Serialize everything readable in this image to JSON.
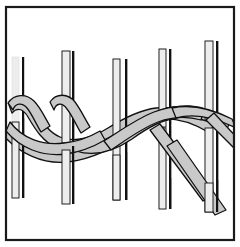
{
  "figure": {
    "title": "Twined basketry weave illustration",
    "canvas": {
      "width": 240,
      "height": 247
    },
    "frame": {
      "name": "illustration-border",
      "x": 5,
      "y": 6,
      "width": 230,
      "height": 235,
      "stroke_color": "#1a1a1a",
      "stroke_width": 2,
      "fill_color": "#ffffff"
    },
    "palette": {
      "background": "#ffffff",
      "warp_fill": "#ededed",
      "warp_outline": "#111111",
      "weaver_fill": "#c9c9c9",
      "weaver_fill_shadow": "#b4b4b4",
      "weaver_outline": "#111111",
      "border": "#1a1a1a"
    },
    "warp_label": "vertical warp stake",
    "weaver_label": "horizontal weaver strand",
    "warps": [
      {
        "id": "warp-1",
        "x_light": 12,
        "x_dark": 22,
        "top": 57,
        "bottom": 198,
        "width": 7
      },
      {
        "id": "warp-2",
        "x_light": 62,
        "x_dark": 72,
        "top": 51,
        "bottom": 204,
        "width": 7
      },
      {
        "id": "warp-3",
        "x_light": 113,
        "x_dark": 125,
        "top": 59,
        "bottom": 200,
        "width": 7
      },
      {
        "id": "warp-4",
        "x_light": 159,
        "x_dark": 170,
        "top": 49,
        "bottom": 209,
        "width": 7
      },
      {
        "id": "warp-5",
        "x_light": 205,
        "x_dark": 216,
        "top": 41,
        "bottom": 212,
        "width": 7
      }
    ],
    "weavers": [
      {
        "id": "weaver-upper",
        "name": "upper-weaver-strand",
        "band_width": 11,
        "note": "Starts curled at upper left, dips low on the left, rises over the center, and descends diagonally off the lower right."
      },
      {
        "id": "weaver-lower",
        "name": "lower-weaver-strand",
        "band_width": 11,
        "note": "Starts low at the left edge, twists over and under the upper weaver between warps, exits diagonally to the lower right."
      }
    ],
    "counts": {
      "warp_pairs": 5,
      "warp_strips": 10,
      "weaver_strands": 2
    }
  }
}
